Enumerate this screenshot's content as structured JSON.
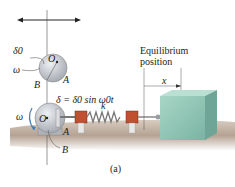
{
  "figure": {
    "caption": "(a)",
    "labels": {
      "delta0": "δ0",
      "omega_top": "ω",
      "O_top": "O",
      "A_top": "A",
      "B_top": "B",
      "equation": "δ = δ0 sin ω0t",
      "omega_bottom": "ω",
      "O_bottom": "O",
      "A_bottom": "A",
      "B_bottom": "B",
      "spring_k": "k",
      "equilibrium_line1": "Equilibrium",
      "equilibrium_line2": "position",
      "x": "x"
    },
    "colors": {
      "disk": "#c9ccd2",
      "block": "#8fc4b4",
      "block_side": "#6fa597",
      "ground": "#b8a89a",
      "spring": "#777777",
      "clamp": "#c0502f"
    }
  }
}
